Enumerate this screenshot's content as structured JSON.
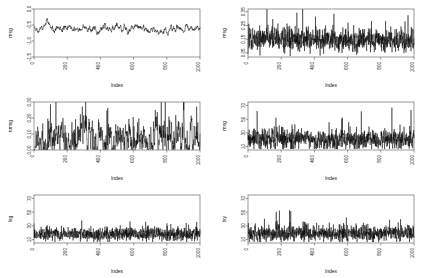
{
  "figure": {
    "background": "#ffffff",
    "line_color": "#000000",
    "axis_color": "#555555",
    "layout": "2 columns x 3 rows of time series plots",
    "n_panels": 6
  },
  "chart_data": [
    {
      "type": "line",
      "panel": "top-left",
      "title": "",
      "xlabel": "Index",
      "ylabel": "msg",
      "xlim": [
        0,
        1000
      ],
      "ylim": [
        -1.5,
        0.0
      ],
      "xticks": [
        0,
        200,
        400,
        600,
        800,
        1000
      ],
      "yticks": [
        0.0,
        -0.5,
        -1.0,
        -1.5
      ],
      "ytick_labels": [
        "0.0",
        "-0.5",
        "-1.0",
        "-1.5"
      ],
      "grid": false,
      "legend": null,
      "seed": 11,
      "noise": 0.14,
      "smooth": 3,
      "mean": -0.62,
      "n": 1000,
      "description": "Smoothly wandering autocorrelated series centered near -0.6, ranging about -1.2 to -0.05"
    },
    {
      "type": "line",
      "panel": "top-right",
      "title": "",
      "xlabel": "Index",
      "ylabel": "msg",
      "xlim": [
        0,
        1000
      ],
      "ylim": [
        0.02,
        0.37
      ],
      "xticks": [
        0,
        200,
        400,
        600,
        800,
        1000
      ],
      "yticks": [
        0.05,
        0.15,
        0.25,
        0.35
      ],
      "ytick_labels": [
        "0.05",
        "0.15",
        "0.25",
        "0.35"
      ],
      "grid": false,
      "legend": null,
      "seed": 23,
      "noise": 0.045,
      "smooth": 0,
      "mean": 0.145,
      "n": 1000,
      "description": "High-frequency white-noise-like series around 0.145 with one tall spike near index 250"
    },
    {
      "type": "line",
      "panel": "middle-left",
      "title": "",
      "xlabel": "Index",
      "ylabel": "nmsg",
      "xlim": [
        0,
        1000
      ],
      "ylim": [
        0.0,
        0.3
      ],
      "xticks": [
        0,
        200,
        400,
        600,
        800,
        1000
      ],
      "yticks": [
        0.0,
        0.1,
        0.2,
        0.3
      ],
      "ytick_labels": [
        "0.00",
        "0.10",
        "0.20",
        "0.30"
      ],
      "grid": false,
      "legend": null,
      "seed": 37,
      "noise": 0.05,
      "smooth": 2,
      "mean": 0.07,
      "n": 1000,
      "description": "Positive skewed bursty series, baseline near 0.04 with repeated spikes reaching 0.25-0.30"
    },
    {
      "type": "line",
      "panel": "middle-right",
      "title": "",
      "xlabel": "Index",
      "ylabel": "msg",
      "xlim": [
        0,
        1000
      ],
      "ylim": [
        5,
        75
      ],
      "xticks": [
        0,
        200,
        400,
        600,
        800,
        1000
      ],
      "yticks": [
        10,
        30,
        50,
        70
      ],
      "ytick_labels": [
        "10",
        "30",
        "50",
        "70"
      ],
      "grid": false,
      "legend": null,
      "seed": 51,
      "noise": 7.5,
      "smooth": 0,
      "mean": 21,
      "n": 1000,
      "description": "Noisy positive series around 21 with sharp spikes up to ~72 near index 140"
    },
    {
      "type": "line",
      "panel": "bottom-left",
      "title": "",
      "xlabel": "Index",
      "ylabel": "lsg",
      "xlim": [
        0,
        1000
      ],
      "ylim": [
        5,
        75
      ],
      "xticks": [
        0,
        200,
        400,
        600,
        800,
        1000
      ],
      "yticks": [
        10,
        30,
        50,
        70
      ],
      "ytick_labels": [
        "10",
        "30",
        "50",
        "70"
      ],
      "grid": false,
      "legend": null,
      "seed": 67,
      "noise": 5.0,
      "smooth": 0,
      "mean": 18,
      "n": 1000,
      "description": "Dense low-amplitude series near 18 with occasional spikes, tallest ~72 near index 520"
    },
    {
      "type": "line",
      "panel": "bottom-right",
      "title": "",
      "xlabel": "Index",
      "ylabel": "lsy",
      "xlim": [
        0,
        1000
      ],
      "ylim": [
        5,
        75
      ],
      "xticks": [
        0,
        200,
        400,
        600,
        800,
        1000
      ],
      "yticks": [
        10,
        30,
        50,
        70
      ],
      "ytick_labels": [
        "10",
        "30",
        "50",
        "70"
      ],
      "grid": false,
      "legend": null,
      "seed": 83,
      "noise": 6.0,
      "smooth": 0,
      "mean": 19,
      "n": 1000,
      "description": "Noisy series near 19 with frequent spikes to 40-55 and maxima ~72 near index 340 and 600"
    }
  ]
}
